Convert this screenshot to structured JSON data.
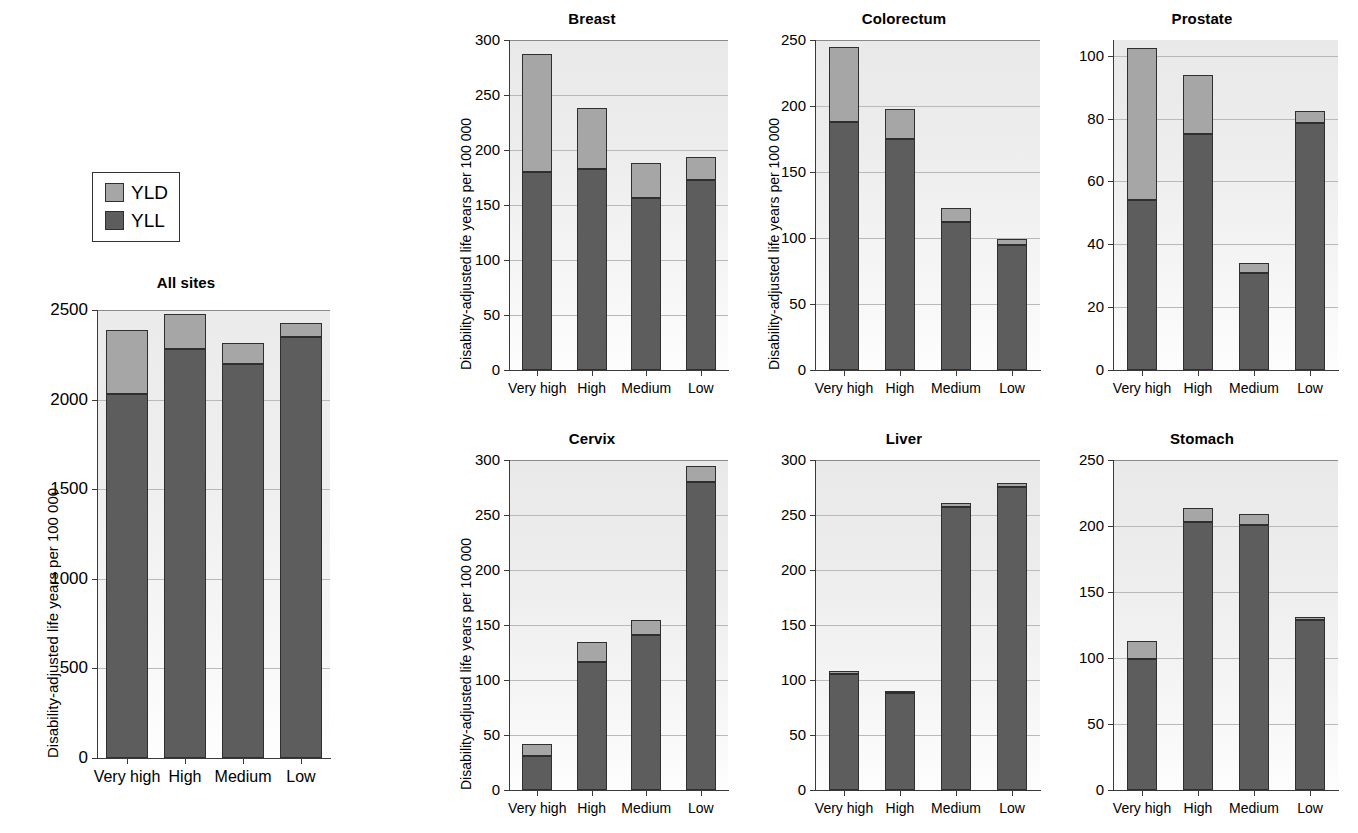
{
  "legend": {
    "position": "top-left",
    "items": [
      {
        "label": "YLD",
        "color": "#a6a6a6"
      },
      {
        "label": "YLL",
        "color": "#5d5d5d"
      }
    ]
  },
  "axis_label": "Disability-adjusted life years per 100 000",
  "categories": [
    "Very high",
    "High",
    "Medium",
    "Low"
  ],
  "chart_data": [
    {
      "type": "bar",
      "title": "All sites",
      "stacked": true,
      "xlabel": "",
      "ylabel": "Disability-adjusted life years per 100 000",
      "categories": [
        "Very high",
        "High",
        "Medium",
        "Low"
      ],
      "ylim": [
        0,
        2500
      ],
      "yticks": [
        0,
        500,
        1000,
        1500,
        2000,
        2500
      ],
      "grid": true,
      "series": [
        {
          "name": "YLL",
          "color": "#5d5d5d",
          "values": [
            2030,
            2280,
            2200,
            2350
          ]
        },
        {
          "name": "YLD",
          "color": "#a6a6a6",
          "values": [
            360,
            200,
            115,
            75
          ]
        }
      ],
      "totals": [
        2390,
        2480,
        2315,
        2425
      ]
    },
    {
      "type": "bar",
      "title": "Breast",
      "stacked": true,
      "xlabel": "",
      "ylabel": "Disability-adjusted life years per 100 000",
      "categories": [
        "Very high",
        "High",
        "Medium",
        "Low"
      ],
      "ylim": [
        0,
        300
      ],
      "yticks": [
        0,
        50,
        100,
        150,
        200,
        250,
        300
      ],
      "grid": true,
      "series": [
        {
          "name": "YLL",
          "color": "#5d5d5d",
          "values": [
            180,
            183,
            156,
            173
          ]
        },
        {
          "name": "YLD",
          "color": "#a6a6a6",
          "values": [
            107,
            55,
            32,
            21
          ]
        }
      ],
      "totals": [
        287,
        238,
        188,
        194
      ]
    },
    {
      "type": "bar",
      "title": "Colorectum",
      "stacked": true,
      "xlabel": "",
      "ylabel": "Disability-adjusted life years per 100 000",
      "categories": [
        "Very high",
        "High",
        "Medium",
        "Low"
      ],
      "ylim": [
        0,
        250
      ],
      "yticks": [
        0,
        50,
        100,
        150,
        200,
        250
      ],
      "grid": true,
      "series": [
        {
          "name": "YLL",
          "color": "#5d5d5d",
          "values": [
            188,
            175,
            112,
            95
          ]
        },
        {
          "name": "YLD",
          "color": "#a6a6a6",
          "values": [
            57,
            23,
            11,
            4
          ]
        }
      ],
      "totals": [
        245,
        198,
        123,
        99
      ]
    },
    {
      "type": "bar",
      "title": "Prostate",
      "stacked": true,
      "xlabel": "",
      "ylabel": "",
      "categories": [
        "Very high",
        "High",
        "Medium",
        "Low"
      ],
      "ylim": [
        0,
        105
      ],
      "yticks": [
        0,
        20,
        40,
        60,
        80,
        100
      ],
      "grid": true,
      "series": [
        {
          "name": "YLL",
          "color": "#5d5d5d",
          "values": [
            54,
            75,
            31,
            78.5
          ]
        },
        {
          "name": "YLD",
          "color": "#a6a6a6",
          "values": [
            48.5,
            19,
            3,
            4
          ]
        }
      ],
      "totals": [
        102.5,
        94,
        34,
        82.5
      ]
    },
    {
      "type": "bar",
      "title": "Cervix",
      "stacked": true,
      "xlabel": "",
      "ylabel": "Disability-adjusted life years per 100 000",
      "categories": [
        "Very high",
        "High",
        "Medium",
        "Low"
      ],
      "ylim": [
        0,
        300
      ],
      "yticks": [
        0,
        50,
        100,
        150,
        200,
        250,
        300
      ],
      "grid": true,
      "series": [
        {
          "name": "YLL",
          "color": "#5d5d5d",
          "values": [
            31,
            116,
            141,
            280
          ]
        },
        {
          "name": "YLD",
          "color": "#a6a6a6",
          "values": [
            11,
            19,
            14,
            15
          ]
        }
      ],
      "totals": [
        42,
        135,
        155,
        295
      ]
    },
    {
      "type": "bar",
      "title": "Liver",
      "stacked": true,
      "xlabel": "",
      "ylabel": "",
      "categories": [
        "Very high",
        "High",
        "Medium",
        "Low"
      ],
      "ylim": [
        0,
        300
      ],
      "yticks": [
        0,
        50,
        100,
        150,
        200,
        250,
        300
      ],
      "grid": true,
      "series": [
        {
          "name": "YLL",
          "color": "#5d5d5d",
          "values": [
            105,
            88,
            257,
            275
          ]
        },
        {
          "name": "YLD",
          "color": "#a6a6a6",
          "values": [
            3,
            2,
            4,
            4
          ]
        }
      ],
      "totals": [
        108,
        90,
        261,
        279
      ]
    },
    {
      "type": "bar",
      "title": "Stomach",
      "stacked": true,
      "xlabel": "",
      "ylabel": "",
      "categories": [
        "Very high",
        "High",
        "Medium",
        "Low"
      ],
      "ylim": [
        0,
        250
      ],
      "yticks": [
        0,
        50,
        100,
        150,
        200,
        250
      ],
      "grid": true,
      "series": [
        {
          "name": "YLL",
          "color": "#5d5d5d",
          "values": [
            99,
            203,
            201,
            129
          ]
        },
        {
          "name": "YLD",
          "color": "#a6a6a6",
          "values": [
            14,
            11,
            8,
            2
          ]
        }
      ],
      "totals": [
        113,
        214,
        209,
        131
      ]
    }
  ]
}
